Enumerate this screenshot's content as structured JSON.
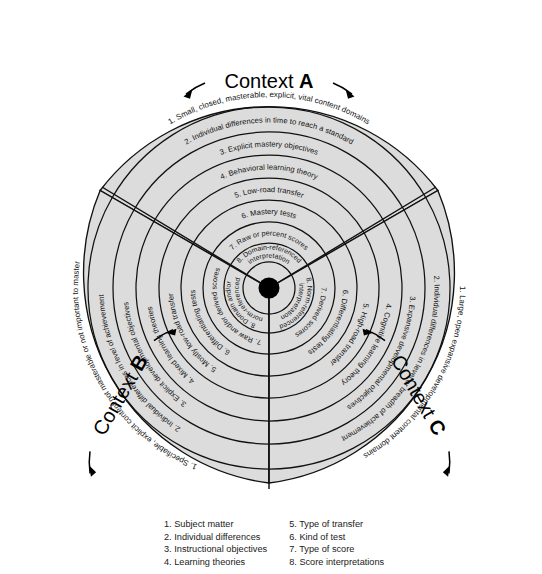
{
  "figure": {
    "center_label": "hub",
    "fill_color": "#dcdcdc",
    "line_color": "#111111"
  },
  "contexts": [
    {
      "id": "A",
      "prefix": "Context ",
      "letter": "A",
      "rings": [
        "1. Small, closed, masterable, explicit, vital content domains",
        "2. Individual differences in time to reach a standard",
        "3. Explicit mastery objectives",
        "4. Behavioral learning theory",
        "5. Low-road transfer",
        "6. Mastery tests",
        "7. Raw or percent scores",
        "8. Domain-referenced interpretation"
      ]
    },
    {
      "id": "B",
      "prefix": "Context ",
      "letter": "B",
      "rings": [
        "1. Specifiable, explicit content not masterable or not important to master",
        "2. Individual differences in level of achievement",
        "3. Explicit developmental objectives",
        "4. Mixed learning theories",
        "5. Mostly low-road transfer",
        "6. Differentiating tests",
        "7. Raw and/or derived scores",
        "8. Domain and/or norm-referenced"
      ]
    },
    {
      "id": "C",
      "prefix": "Context ",
      "letter": "C",
      "rings": [
        "1. Large, open expansive developmental content domains",
        "2. Individual differences in level or breadth of achievement",
        "3. Expansive developmental objectives",
        "4. Cognitive learning theory",
        "5. High-road transfer",
        "6. Differentiating tests",
        "7. Derived scores",
        "8. Norm-referenced interpretation"
      ]
    }
  ],
  "legend": {
    "left_column": [
      "1. Subject matter",
      "2. Individual differences",
      "3. Instructional objectives",
      "4. Learning theories"
    ],
    "right_column": [
      "5. Type of transfer",
      "6. Kind of test",
      "7. Type of score",
      "8. Score interpretations"
    ]
  }
}
